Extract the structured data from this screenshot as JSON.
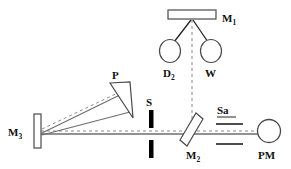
{
  "figure": {
    "type": "optical-ray-diagram",
    "background_color": "#ffffff",
    "line_color": "#555555",
    "label_color": "#111111",
    "solid_beam_color": "#666666",
    "dashed_beam_color": "#777777"
  },
  "components": {
    "mirror_top": {
      "name": "M",
      "subscript": "1",
      "label": "M₁",
      "shape": "rectangle",
      "x": 168,
      "y": 10,
      "w": 48,
      "h": 9,
      "label_x": 222,
      "label_y": 22
    },
    "lamp_deuterium": {
      "name": "D",
      "subscript": "2",
      "label": "D₂",
      "shape": "ellipse",
      "cx": 170,
      "cy": 51,
      "rx": 10,
      "ry": 11,
      "label_x": 163,
      "label_y": 76
    },
    "lamp_tungsten": {
      "name": "W",
      "subscript": "",
      "label": "W",
      "shape": "ellipse",
      "cx": 211,
      "cy": 51,
      "rx": 10,
      "ry": 11,
      "label_x": 205,
      "label_y": 76
    },
    "prism": {
      "name": "P",
      "subscript": "",
      "label": "P",
      "shape": "wedge-triangle",
      "label_x": 114,
      "label_y": 78
    },
    "slit": {
      "name": "S",
      "subscript": "",
      "label": "S",
      "shape": "двух-bar-slit",
      "x": 151,
      "y_top": 110,
      "y_bot": 133,
      "bar_w": 4,
      "bar_h": 17,
      "label_x": 147,
      "label_y": 106
    },
    "mirror_left": {
      "name": "M",
      "subscript": "3",
      "label": "M₃",
      "shape": "rectangle-vertical",
      "x": 35,
      "y": 114,
      "w": 7,
      "h": 33,
      "label_x": 10,
      "label_y": 134
    },
    "beamsplitter": {
      "name": "M",
      "subscript": "2",
      "label": "M₂",
      "shape": "tilted-plate",
      "label_x": 192,
      "label_y": 158
    },
    "sample": {
      "name": "Sa",
      "subscript": "",
      "label": "Sa",
      "shape": "two-plates",
      "label_x": 219,
      "label_y": 114,
      "plate_top_y": 124,
      "plate_bot_y": 143,
      "plate_x1": 216,
      "plate_x2": 243
    },
    "detector": {
      "name": "PM",
      "subscript": "",
      "label": "PM",
      "shape": "circle",
      "cx": 269,
      "cy": 131,
      "r": 11,
      "label_x": 259,
      "label_y": 158
    }
  },
  "beams": {
    "optical_axis_label": "dashed optical axis",
    "source_rays_label": "lamp rays to M1",
    "dispersed_rays_label": "prism dispersed rays"
  }
}
